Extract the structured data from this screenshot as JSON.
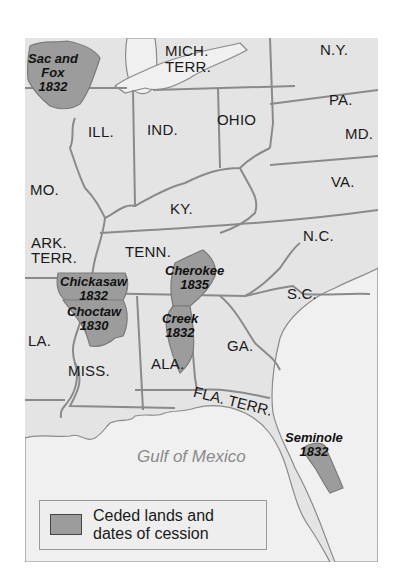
{
  "colors": {
    "land": "#e4e4e4",
    "water": "#f2f2f2",
    "ceded": "#9c9c9c",
    "border": "#8a8a8a",
    "gulf_label": "#8a8a8a"
  },
  "states": [
    {
      "id": "mich-terr",
      "lines": [
        "MICH.",
        "TERR."
      ]
    },
    {
      "id": "ny",
      "label": "N.Y."
    },
    {
      "id": "pa",
      "label": "PA."
    },
    {
      "id": "md",
      "label": "MD."
    },
    {
      "id": "ill",
      "label": "ILL."
    },
    {
      "id": "ind",
      "label": "IND."
    },
    {
      "id": "ohio",
      "label": "OHIO"
    },
    {
      "id": "va",
      "label": "VA."
    },
    {
      "id": "mo",
      "label": "MO."
    },
    {
      "id": "ky",
      "label": "KY."
    },
    {
      "id": "ark-terr",
      "lines": [
        "ARK.",
        "TERR."
      ]
    },
    {
      "id": "tenn",
      "label": "TENN."
    },
    {
      "id": "nc",
      "label": "N.C."
    },
    {
      "id": "sc",
      "label": "S.C."
    },
    {
      "id": "la",
      "label": "LA."
    },
    {
      "id": "miss",
      "label": "MISS."
    },
    {
      "id": "ala",
      "label": "ALA."
    },
    {
      "id": "ga",
      "label": "GA."
    },
    {
      "id": "fla-terr",
      "label": "FLA. TERR."
    }
  ],
  "cessions": [
    {
      "nation": "Sac and Fox",
      "lines": [
        "Sac and",
        "Fox"
      ],
      "year": "1832"
    },
    {
      "nation": "Chickasaw",
      "lines": [
        "Chickasaw"
      ],
      "year": "1832"
    },
    {
      "nation": "Choctaw",
      "lines": [
        "Choctaw"
      ],
      "year": "1830"
    },
    {
      "nation": "Cherokee",
      "lines": [
        "Cherokee"
      ],
      "year": "1835"
    },
    {
      "nation": "Creek",
      "lines": [
        "Creek"
      ],
      "year": "1832"
    },
    {
      "nation": "Seminole",
      "lines": [
        "Seminole"
      ],
      "year": "1832"
    }
  ],
  "water_labels": {
    "gulf": "Gulf of Mexico"
  },
  "legend": {
    "swatch": "ceded-lands-swatch",
    "line1": "Ceded lands and",
    "line2": "dates of cession"
  }
}
